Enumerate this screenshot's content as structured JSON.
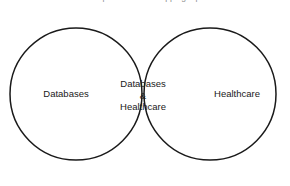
{
  "figure": {
    "kind": "venn-diagram",
    "caption_remnant": "a comparison of overlapping topics",
    "background_color": "#ffffff",
    "outline_color": "#1a1a1a",
    "intersection_fill_color": "#c4c4c4",
    "circle_fill_color": "#ffffff"
  },
  "sets": {
    "left": {
      "label": "Databases",
      "center_x": 76,
      "center_y": 94,
      "radius": 66
    },
    "right": {
      "label": "Healthcare",
      "center_x": 210,
      "center_y": 94,
      "radius": 66
    }
  },
  "intersection": {
    "line1": "Databases",
    "line2": "&",
    "line3": "Healthcare",
    "center_x": 143,
    "top_vertex_y": 28,
    "bottom_vertex_y": 158
  }
}
